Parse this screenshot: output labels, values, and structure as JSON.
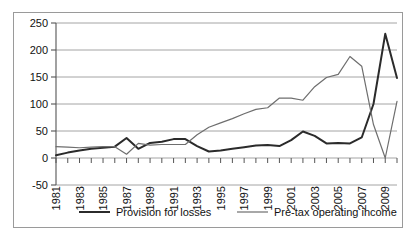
{
  "chart_data": {
    "type": "line",
    "title": "",
    "subtitle": "",
    "xlabel": "",
    "ylabel": "",
    "ylim": [
      -50,
      250
    ],
    "xlim": [
      1981,
      2010
    ],
    "yticks": [
      -50,
      0,
      50,
      100,
      150,
      200,
      250
    ],
    "ytick_labels": [
      "-50",
      "0",
      "50",
      "100",
      "150",
      "200",
      "250"
    ],
    "grid": "horizontal",
    "legend_position": "bottom",
    "x": [
      1981,
      1982,
      1983,
      1984,
      1985,
      1986,
      1987,
      1988,
      1989,
      1990,
      1991,
      1992,
      1993,
      1994,
      1995,
      1996,
      1997,
      1998,
      1999,
      2000,
      2001,
      2002,
      2003,
      2004,
      2005,
      2006,
      2007,
      2008,
      2009,
      2010
    ],
    "xtick_labels": [
      "1981",
      "",
      "1983",
      "",
      "1985",
      "",
      "1987",
      "",
      "1989",
      "",
      "1991",
      "",
      "1993",
      "",
      "1995",
      "",
      "1997",
      "",
      "1999",
      "",
      "2001",
      "",
      "2003",
      "",
      "2005",
      "",
      "2007",
      "",
      "2009",
      ""
    ],
    "xtick_labels_visible": [
      "1981",
      "1983",
      "1985",
      "1987",
      "1989",
      "1991",
      "1993",
      "1995",
      "1997",
      "1999",
      "2001",
      "2003",
      "2005",
      "2007",
      "2009"
    ],
    "series": [
      {
        "name": "Provision for losses",
        "color": "#2b2b2b",
        "width": 2.0,
        "values": [
          5,
          10,
          14,
          17,
          19,
          21,
          37,
          17,
          28,
          30,
          35,
          35,
          22,
          12,
          14,
          17,
          20,
          23,
          24,
          22,
          33,
          49,
          41,
          27,
          28,
          27,
          38,
          100,
          230,
          148
        ]
      },
      {
        "name": "Pre-tax operating income",
        "color": "#6e6e6e",
        "width": 1.2,
        "values": [
          21,
          20,
          19,
          20,
          21,
          21,
          7,
          27,
          24,
          25,
          25,
          25,
          43,
          57,
          65,
          73,
          82,
          90,
          93,
          111,
          111,
          107,
          132,
          149,
          155,
          188,
          170,
          62,
          0,
          105
        ]
      }
    ]
  },
  "legend": {
    "items": [
      {
        "label": "Provision for losses",
        "color": "#2b2b2b"
      },
      {
        "label": "Pre-tax operating income",
        "color": "#6e6e6e"
      }
    ]
  }
}
